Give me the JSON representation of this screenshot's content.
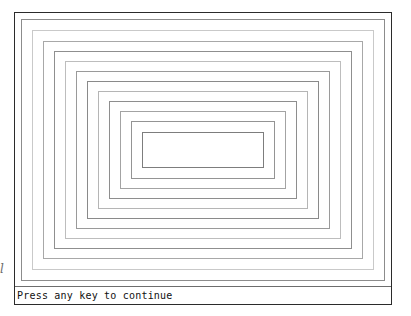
{
  "screen": {
    "width": 411,
    "height": 316,
    "background_color": "#ffffff"
  },
  "window": {
    "border_color": "#2b2b2b",
    "background_color": "#ffffff",
    "x": 14,
    "y": 12,
    "width": 378,
    "height": 293
  },
  "drawing": {
    "name": "concentric-rectangles",
    "count": 12,
    "rectangles": [
      {
        "index": 1,
        "left": 6,
        "top": 6,
        "width": 364,
        "height": 262,
        "color": "#8c8c8c"
      },
      {
        "index": 2,
        "left": 17,
        "top": 17,
        "width": 342,
        "height": 240,
        "color": "#c9c9c9"
      },
      {
        "index": 3,
        "left": 28,
        "top": 28,
        "width": 320,
        "height": 218,
        "color": "#a8a8a8"
      },
      {
        "index": 4,
        "left": 39,
        "top": 38,
        "width": 298,
        "height": 198,
        "color": "#8f8f8f"
      },
      {
        "index": 5,
        "left": 50,
        "top": 48,
        "width": 276,
        "height": 178,
        "color": "#bdbdbd"
      },
      {
        "index": 6,
        "left": 61,
        "top": 58,
        "width": 254,
        "height": 158,
        "color": "#9a9a9a"
      },
      {
        "index": 7,
        "left": 72,
        "top": 68,
        "width": 232,
        "height": 138,
        "color": "#8a8a8a"
      },
      {
        "index": 8,
        "left": 83,
        "top": 78,
        "width": 210,
        "height": 118,
        "color": "#b5b5b5"
      },
      {
        "index": 9,
        "left": 94,
        "top": 88,
        "width": 188,
        "height": 98,
        "color": "#8e8e8e"
      },
      {
        "index": 10,
        "left": 105,
        "top": 98,
        "width": 166,
        "height": 78,
        "color": "#a3a3a3"
      },
      {
        "index": 11,
        "left": 116,
        "top": 108,
        "width": 144,
        "height": 58,
        "color": "#949494"
      },
      {
        "index": 12,
        "left": 127,
        "top": 119,
        "width": 122,
        "height": 36,
        "color": "#7d7d7d"
      }
    ]
  },
  "status_bar": {
    "message": "Press any key to continue",
    "text_color": "#111111",
    "separator_color": "#6d6d6d"
  },
  "edge_artifact": {
    "glyph": "l"
  }
}
